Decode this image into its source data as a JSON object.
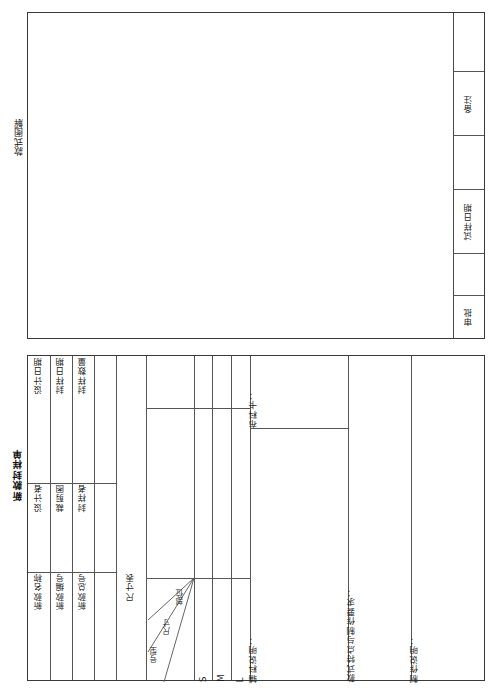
{
  "document": {
    "type": "garment-sample-form",
    "orientation": "rotated-90",
    "illustration": {
      "section_label": "款式图解",
      "right_column": [
        {
          "label": "备注"
        },
        {
          "label": "试样日期"
        },
        {
          "label": "审批"
        }
      ]
    },
    "form": {
      "title": "新款封样单",
      "header_rows": [
        {
          "field_a": "新款名称",
          "field_b": "设计者",
          "field_c": "设计日期"
        },
        {
          "field_a": "新款编号",
          "field_b": "裁剪图",
          "field_c": "封样日期"
        },
        {
          "field_a": "新款总号",
          "field_b": "封样者",
          "field_c": "封样数量"
        }
      ],
      "size_table": {
        "label": "尺寸表",
        "corner": {
          "top": "部位",
          "middle": "尺寸",
          "bottom": "号型"
        },
        "sizes": [
          "S",
          "M",
          "L"
        ],
        "columns": [
          "",
          "",
          ""
        ]
      },
      "notes": [
        {
          "label": "布料卡："
        },
        {
          "label": "辅料说明："
        },
        {
          "label": "款式特点与制作要求："
        },
        {
          "label": "制作说明："
        }
      ]
    },
    "colors": {
      "border_outer": "#3a3a3a",
      "border_inner": "#555555",
      "paper": "#ffffff",
      "ink": "#111111"
    }
  }
}
